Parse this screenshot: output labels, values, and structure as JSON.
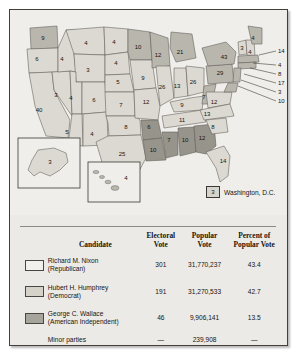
{
  "figure": {
    "type": "electoral-map-with-results-table",
    "title_visible": false
  },
  "map": {
    "dc_legend": {
      "value": "3",
      "label": "Washington, D.C."
    },
    "insets": [
      {
        "name": "alaska",
        "value": "3"
      },
      {
        "name": "hawaii",
        "value": "4"
      }
    ],
    "states": [
      {
        "code": "WA",
        "value": "9",
        "winner": "humphrey",
        "x": 33,
        "y": 28
      },
      {
        "code": "OR",
        "value": "6",
        "winner": "nixon",
        "x": 27,
        "y": 49
      },
      {
        "code": "CA",
        "value": "40",
        "winner": "nixon",
        "x": 29,
        "y": 100
      },
      {
        "code": "NV",
        "value": "3",
        "winner": "nixon",
        "x": 46,
        "y": 85
      },
      {
        "code": "ID",
        "value": "4",
        "winner": "nixon",
        "x": 52,
        "y": 49
      },
      {
        "code": "MT",
        "value": "4",
        "winner": "nixon",
        "x": 76,
        "y": 33
      },
      {
        "code": "WY",
        "value": "3",
        "winner": "nixon",
        "x": 78,
        "y": 60
      },
      {
        "code": "UT",
        "value": "4",
        "winner": "nixon",
        "x": 61,
        "y": 88
      },
      {
        "code": "CO",
        "value": "6",
        "winner": "nixon",
        "x": 84,
        "y": 90
      },
      {
        "code": "AZ",
        "value": "5",
        "winner": "nixon",
        "x": 57,
        "y": 122
      },
      {
        "code": "NM",
        "value": "4",
        "winner": "nixon",
        "x": 82,
        "y": 124
      },
      {
        "code": "ND",
        "value": "4",
        "winner": "nixon",
        "x": 104,
        "y": 32
      },
      {
        "code": "SD",
        "value": "4",
        "winner": "nixon",
        "x": 106,
        "y": 53
      },
      {
        "code": "NE",
        "value": "5",
        "winner": "nixon",
        "x": 108,
        "y": 72
      },
      {
        "code": "KS",
        "value": "7",
        "winner": "nixon",
        "x": 111,
        "y": 95
      },
      {
        "code": "OK",
        "value": "8",
        "winner": "nixon",
        "x": 116,
        "y": 117
      },
      {
        "code": "TX",
        "value": "25",
        "winner": "nixon",
        "x": 112,
        "y": 144
      },
      {
        "code": "MN",
        "value": "10",
        "winner": "humphrey",
        "x": 128,
        "y": 37
      },
      {
        "code": "IA",
        "value": "9",
        "winner": "nixon",
        "x": 133,
        "y": 68
      },
      {
        "code": "MO",
        "value": "12",
        "winner": "nixon",
        "x": 136,
        "y": 92
      },
      {
        "code": "AR",
        "value": "6",
        "winner": "wallace",
        "x": 139,
        "y": 117
      },
      {
        "code": "LA",
        "value": "10",
        "winner": "wallace",
        "x": 143,
        "y": 140
      },
      {
        "code": "WI",
        "value": "12",
        "winner": "humphrey",
        "x": 148,
        "y": 45
      },
      {
        "code": "IL",
        "value": "26",
        "winner": "nixon",
        "x": 152,
        "y": 77
      },
      {
        "code": "MS",
        "value": "7",
        "winner": "wallace",
        "x": 159,
        "y": 130
      },
      {
        "code": "MI",
        "value": "21",
        "winner": "humphrey",
        "x": 170,
        "y": 42
      },
      {
        "code": "IN",
        "value": "13",
        "winner": "nixon",
        "x": 167,
        "y": 76
      },
      {
        "code": "KY",
        "value": "9",
        "winner": "nixon",
        "x": 172,
        "y": 95
      },
      {
        "code": "TN",
        "value": "11",
        "winner": "nixon",
        "x": 172,
        "y": 110
      },
      {
        "code": "AL",
        "value": "10",
        "winner": "wallace",
        "x": 175,
        "y": 130
      },
      {
        "code": "OH",
        "value": "26",
        "winner": "nixon",
        "x": 183,
        "y": 72
      },
      {
        "code": "GA",
        "value": "12",
        "winner": "wallace",
        "x": 192,
        "y": 128
      },
      {
        "code": "WV",
        "value": "7",
        "winner": "humphrey",
        "x": 194,
        "y": 87
      },
      {
        "code": "NC",
        "value": "13",
        "winner": "nixon",
        "x": 197,
        "y": 104
      },
      {
        "code": "SC",
        "value": "8",
        "winner": "nixon",
        "x": 203,
        "y": 117
      },
      {
        "code": "VA",
        "value": "12",
        "winner": "nixon",
        "x": 204,
        "y": 92
      },
      {
        "code": "FL",
        "value": "14",
        "winner": "nixon",
        "x": 213,
        "y": 151
      },
      {
        "code": "PA",
        "value": "29",
        "winner": "humphrey",
        "x": 210,
        "y": 63
      },
      {
        "code": "NY",
        "value": "43",
        "winner": "humphrey",
        "x": 214,
        "y": 47
      },
      {
        "code": "VT",
        "value": "3",
        "winner": "nixon",
        "x": 232,
        "y": 38
      },
      {
        "code": "NH",
        "value": "4",
        "winner": "nixon",
        "x": 240,
        "y": 42
      },
      {
        "code": "ME",
        "value": "4",
        "winner": "humphrey",
        "x": 243,
        "y": 28
      }
    ],
    "leader_labels": [
      {
        "value": "14",
        "x": 268,
        "y": 41,
        "lx": 249,
        "ly": 45
      },
      {
        "value": "4",
        "x": 268,
        "y": 55,
        "lx": 243,
        "ly": 53
      },
      {
        "value": "8",
        "x": 268,
        "y": 64,
        "lx": 240,
        "ly": 58
      },
      {
        "value": "17",
        "x": 268,
        "y": 73,
        "lx": 234,
        "ly": 64
      },
      {
        "value": "3",
        "x": 268,
        "y": 82,
        "lx": 231,
        "ly": 70
      },
      {
        "value": "10",
        "x": 268,
        "y": 91,
        "lx": 228,
        "ly": 76
      }
    ]
  },
  "table": {
    "headers": {
      "candidate": "Candidate",
      "electoral_vote": "Electoral\nVote",
      "electoral_vote_l1": "Electoral",
      "electoral_vote_l2": "Vote",
      "popular_vote_l1": "Popular",
      "popular_vote_l2": "Vote",
      "percent_l1": "Percent of",
      "percent_l2": "Popular Vote"
    },
    "rows": [
      {
        "name_l1": "Richard M. Nixon",
        "name_l2": "(Republican)",
        "electoral_vote": "301",
        "popular_vote": "31,770,237",
        "percent": "43.4",
        "swatch": "#f2f0ec"
      },
      {
        "name_l1": "Hubert H. Humphrey",
        "name_l2": "(Democrat)",
        "electoral_vote": "191",
        "popular_vote": "31,270,533",
        "percent": "42.7",
        "swatch": "#d5d2ca"
      },
      {
        "name_l1": "George C. Wallace",
        "name_l2": "(American Independent)",
        "electoral_vote": "46",
        "popular_vote": "9,906,141",
        "percent": "13.5",
        "swatch": "#a7a49c"
      }
    ],
    "minor": {
      "name_l1": "Minor parties",
      "name_l2": "",
      "electoral_vote": "—",
      "popular_vote": "239,908",
      "percent": "—"
    }
  },
  "colors": {
    "nixon_fill": "#dcd9d2",
    "humphrey_fill": "#b9b6ae",
    "wallace_fill": "#97948c",
    "inset_fill": "#d7d4cd",
    "panel_bg": "#eceae6",
    "map_bg": "#efeeea",
    "border": "#43403c"
  }
}
